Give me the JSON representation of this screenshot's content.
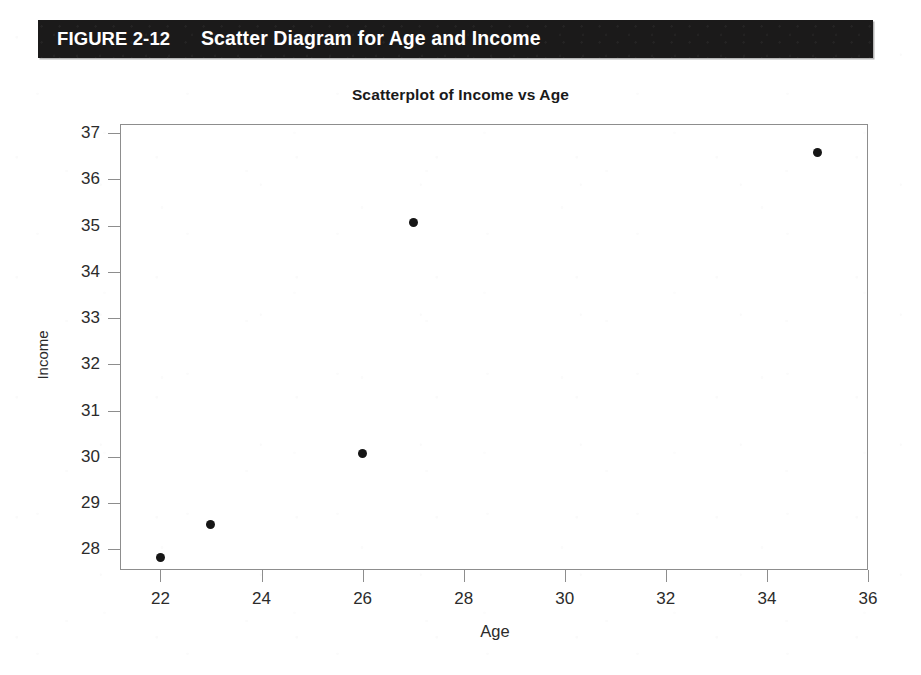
{
  "figure": {
    "label": "FIGURE 2-12",
    "title": "Scatter Diagram for Age and Income",
    "band_color": "#1b1a1a",
    "band_text_color": "#ffffff"
  },
  "chart_data": {
    "type": "scatter",
    "title": "Scatterplot of Income vs Age",
    "xlabel": "Age",
    "ylabel": "Income",
    "xlim": [
      21.2,
      36.0
    ],
    "ylim": [
      27.55,
      37.2
    ],
    "xticks": [
      22,
      24,
      26,
      28,
      30,
      32,
      34,
      36
    ],
    "yticks": [
      28,
      29,
      30,
      31,
      32,
      33,
      34,
      35,
      36,
      37
    ],
    "xtick_labels": [
      "22",
      "24",
      "26",
      "28",
      "30",
      "32",
      "34",
      "36"
    ],
    "ytick_labels": [
      "28",
      "29",
      "30",
      "31",
      "32",
      "33",
      "34",
      "35",
      "36",
      "37"
    ],
    "grid": false,
    "legend": false,
    "marker": "filled-circle",
    "marker_color": "#161616",
    "points": [
      {
        "x": 22,
        "y": 27.82
      },
      {
        "x": 23,
        "y": 28.53
      },
      {
        "x": 26,
        "y": 30.08
      },
      {
        "x": 27,
        "y": 35.07
      },
      {
        "x": 35,
        "y": 36.59
      }
    ],
    "x": [
      22,
      23,
      26,
      27,
      35
    ],
    "y": [
      27.82,
      28.53,
      30.08,
      35.07,
      36.59
    ]
  }
}
